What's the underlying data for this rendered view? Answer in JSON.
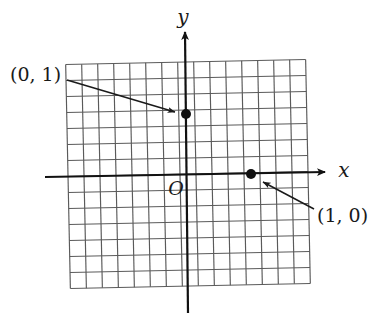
{
  "figure": {
    "kind": "coordinate-plane-sketch",
    "background_color": "#ffffff",
    "ink_color": "#1a1a1a",
    "grid_color": "#555555",
    "axis_color": "#111111"
  },
  "axes": {
    "x_axis_label": "x",
    "y_axis_label": "y",
    "origin_label": "O",
    "x_axis": {
      "x1": 45,
      "y1": 177,
      "x2": 325,
      "y2": 172
    },
    "y_axis": {
      "x1": 188,
      "y1": 313,
      "x2": 185,
      "y2": 32
    },
    "x_label_pos": {
      "x": 344,
      "y": 177
    },
    "y_label_pos": {
      "x": 183,
      "y": 24
    },
    "origin_label_pos": {
      "x": 176,
      "y": 195
    }
  },
  "grid": {
    "left": 68,
    "top": 62,
    "right": 308,
    "bottom": 286,
    "spacing": 16,
    "columns": 16,
    "rows": 15,
    "tilt_deg": -1.2
  },
  "points": [
    {
      "name": "point-0-1",
      "label": "(0, 1)",
      "dot": {
        "x": 186,
        "y": 114,
        "r": 5
      },
      "label_pos": {
        "x": 10,
        "y": 81
      },
      "leader": {
        "x1": 67,
        "y1": 80,
        "x2": 175,
        "y2": 112
      }
    },
    {
      "name": "point-1-0",
      "label": "(1, 0)",
      "dot": {
        "x": 251,
        "y": 174,
        "r": 5
      },
      "label_pos": {
        "x": 317,
        "y": 222
      },
      "leader": {
        "x1": 314,
        "y1": 209,
        "x2": 263,
        "y2": 182
      }
    }
  ],
  "chart_data": {
    "type": "scatter",
    "title": "",
    "xlabel": "x",
    "ylabel": "y",
    "grid": true,
    "legend": "none",
    "xlim": [
      -7.5,
      7.5
    ],
    "ylim": [
      -7,
      7
    ],
    "points": [
      {
        "x": 0,
        "y": 1,
        "label": "(0, 1)"
      },
      {
        "x": 1,
        "y": 0,
        "label": "(1, 0)"
      }
    ],
    "annotations": [
      {
        "text": "(0, 1)",
        "target_x": 0,
        "target_y": 1
      },
      {
        "text": "(1, 0)",
        "target_x": 1,
        "target_y": 0
      },
      {
        "text": "O",
        "target_x": 0,
        "target_y": 0
      }
    ]
  }
}
